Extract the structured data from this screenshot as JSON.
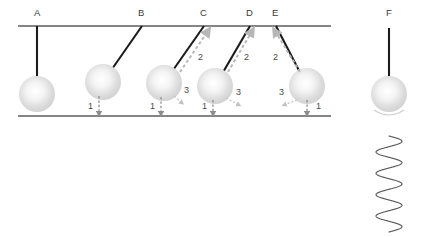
{
  "figure": {
    "background_color": "#ffffff",
    "rod_color": "#1c1c1c",
    "line_color": "#5c5c5c",
    "arrow_color": "#b7b7b7",
    "bob_color": "#d8d8d8",
    "spring_color": "#5a5a5a"
  },
  "support": {
    "ceiling": {
      "x1": 18,
      "y": 26,
      "x2": 331
    },
    "ground": {
      "x1": 18,
      "y": 116,
      "x2": 331
    }
  },
  "labels": {
    "a": "A",
    "b": "B",
    "c": "C",
    "d": "D",
    "e": "E",
    "f": "F",
    "one": "1",
    "two": "2",
    "three": "3"
  },
  "pendulums": [
    {
      "id": "A",
      "letter": "A",
      "pivot_x": 37,
      "pivot_y": 26,
      "bob_x": 37,
      "bob_y": 94,
      "bob_r": 18,
      "label_x": 34,
      "label_y": 16,
      "has_rise_arrow": false,
      "has_drop_marker": false,
      "has_three": false
    },
    {
      "id": "B",
      "letter": "B",
      "pivot_x": 142,
      "pivot_y": 26,
      "bob_x": 103,
      "bob_y": 82,
      "bob_r": 18,
      "label_x": 138,
      "label_y": 16,
      "has_rise_arrow": false,
      "has_drop_marker": true,
      "drop_x": 99,
      "one_x": 88,
      "one_y": 109,
      "has_three": false
    },
    {
      "id": "C",
      "letter": "C",
      "pivot_x": 204,
      "pivot_y": 26,
      "bob_x": 164,
      "bob_y": 83,
      "bob_r": 18,
      "label_x": 200,
      "label_y": 16,
      "has_rise_arrow": true,
      "arrow_x1": 180,
      "arrow_y1": 72,
      "arrow_x2": 208,
      "arrow_y2": 31,
      "two_x": 198,
      "two_y": 60,
      "has_drop_marker": true,
      "drop_x": 161,
      "one_x": 150,
      "one_y": 109,
      "has_three": true,
      "three_x": 184,
      "three_y": 93,
      "three_ax1": 174,
      "three_ay1": 96,
      "three_ax2": 182,
      "three_ay2": 103
    },
    {
      "id": "D",
      "letter": "D",
      "pivot_x": 250,
      "pivot_y": 26,
      "bob_x": 215,
      "bob_y": 86,
      "bob_r": 18,
      "label_x": 246,
      "label_y": 16,
      "has_rise_arrow": true,
      "arrow_x1": 228,
      "arrow_y1": 72,
      "arrow_x2": 252,
      "arrow_y2": 31,
      "two_x": 244,
      "two_y": 60,
      "has_drop_marker": true,
      "drop_x": 213,
      "one_x": 202,
      "one_y": 109,
      "has_three": true,
      "three_x": 236,
      "three_y": 95,
      "three_ax1": 226,
      "three_ay1": 98,
      "three_ax2": 239,
      "three_ay2": 105
    },
    {
      "id": "E",
      "letter": "E",
      "pivot_x": 276,
      "pivot_y": 26,
      "bob_x": 307,
      "bob_y": 86,
      "bob_r": 18,
      "label_x": 272,
      "label_y": 16,
      "has_rise_arrow": true,
      "arrow_x1": 300,
      "arrow_y1": 72,
      "arrow_x2": 275,
      "arrow_y2": 31,
      "two_x": 273,
      "two_y": 60,
      "has_drop_marker": true,
      "drop_x": 307,
      "one_x": 317,
      "one_y": 109,
      "has_three": true,
      "three_x": 279,
      "three_y": 95,
      "three_ax1": 297,
      "three_ay1": 100,
      "three_ax2": 284,
      "three_ay2": 105
    },
    {
      "id": "F",
      "letter": "F",
      "pivot_x": 389,
      "pivot_y": 28,
      "bob_x": 389,
      "bob_y": 94,
      "bob_r": 18,
      "label_x": 386,
      "label_y": 16,
      "has_rise_arrow": false,
      "has_drop_marker": false,
      "has_three": false,
      "has_swing_arc": true
    }
  ],
  "spring": {
    "center_x": 389,
    "top_y": 136,
    "bottom_y": 232,
    "amplitude": 13,
    "turns": 4.5,
    "description": "vertical oscillating sine wave"
  },
  "annotations": {
    "one_meaning": "lowest point marker",
    "two_meaning": "upward swing direction",
    "three_meaning": "downward swing direction"
  }
}
